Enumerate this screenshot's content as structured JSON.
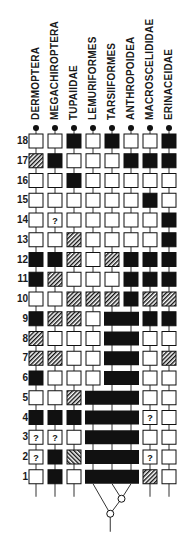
{
  "figure": {
    "taxa": [
      {
        "name": "DERMOPTERA",
        "x": 36
      },
      {
        "name": "MEGACHIROPTERA",
        "x": 55
      },
      {
        "name": "TUPAIIDAE",
        "x": 74
      },
      {
        "name": "LEMURIFORMES",
        "x": 93
      },
      {
        "name": "TARSIIFORMES",
        "x": 112
      },
      {
        "name": "ANTHROPOIDEA",
        "x": 131
      },
      {
        "name": "MACROSCELIDIDAE",
        "x": 150
      },
      {
        "name": "ERINACEIDAE",
        "x": 169
      }
    ],
    "legend_states": {
      "W": "absent (open square)",
      "B": "derived (filled square)",
      "H": "intermediate (hatched square)",
      "R": "intermediate (reverse hatched square)",
      "Q": "unknown (?)",
      "bar": "shared derived state (continuous bar)"
    },
    "characters": [
      {
        "num": "18",
        "states": [
          "W",
          "W",
          "B",
          "W",
          "B",
          "W",
          "W",
          "B"
        ]
      },
      {
        "num": "17",
        "states": [
          "H",
          "B",
          "W",
          "W",
          "W",
          "B",
          "B",
          "B"
        ]
      },
      {
        "num": "16",
        "states": [
          "W",
          "W",
          "B",
          "W",
          "W",
          "W",
          "W",
          "W"
        ]
      },
      {
        "num": "15",
        "states": [
          "W",
          "W",
          "W",
          "W",
          "W",
          "W",
          "B",
          "W"
        ]
      },
      {
        "num": "14",
        "states": [
          "W",
          "Q",
          "W",
          "W",
          "W",
          "W",
          "W",
          "B"
        ]
      },
      {
        "num": "13",
        "states": [
          "W",
          "W",
          "H",
          "W",
          "W",
          "W",
          "W",
          "B"
        ]
      },
      {
        "num": "12",
        "states": [
          "B",
          "B",
          "H",
          "W",
          "H",
          "B",
          "B",
          "B"
        ]
      },
      {
        "num": "11",
        "states": [
          "B",
          "H",
          "W",
          "W",
          "W",
          "B",
          "B",
          "B"
        ]
      },
      {
        "num": "10",
        "states": [
          "W",
          "W",
          "H",
          "H",
          "H",
          "B",
          "H",
          "H"
        ]
      },
      {
        "num": "9",
        "states": [
          "B",
          "H",
          "H",
          "W",
          "bar",
          "bar",
          "B",
          "B"
        ]
      },
      {
        "num": "8",
        "states": [
          "H",
          "W",
          "W",
          "W",
          "bar",
          "bar",
          "W",
          "W"
        ]
      },
      {
        "num": "7",
        "states": [
          "H",
          "H",
          "W",
          "W",
          "bar",
          "bar",
          "W",
          "H"
        ]
      },
      {
        "num": "6",
        "states": [
          "B",
          "W",
          "W",
          "W",
          "bar",
          "bar",
          "W",
          "W"
        ]
      },
      {
        "num": "5",
        "states": [
          "W",
          "W",
          "H",
          "bar",
          "bar",
          "bar",
          "W",
          "W"
        ]
      },
      {
        "num": "4",
        "states": [
          "B",
          "B",
          "B",
          "bar",
          "bar",
          "bar",
          "Q",
          "W"
        ]
      },
      {
        "num": "3",
        "states": [
          "Q",
          "Q",
          "W",
          "bar",
          "bar",
          "bar",
          "W",
          "W"
        ]
      },
      {
        "num": "2",
        "states": [
          "Q",
          "B",
          "R",
          "bar",
          "bar",
          "bar",
          "Q",
          "W"
        ]
      },
      {
        "num": "1",
        "states": [
          "W",
          "B",
          "W",
          "bar",
          "bar",
          "bar",
          "H",
          "W"
        ]
      }
    ],
    "unknown_glyph": "?",
    "colors": {
      "ink": "#111111",
      "paper": "#ffffff",
      "line": "#333333"
    },
    "tree": {
      "description": "Lemuriformes, Tarsiiformes and Anthropoidea joined below matrix: (Lemuriformes, (Tarsiiformes, Anthropoidea))"
    }
  }
}
